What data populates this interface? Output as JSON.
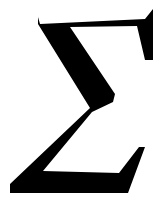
{
  "symbol": {
    "character": "Σ",
    "name": "Sigma",
    "color": "#000000",
    "background": "#ffffff"
  }
}
